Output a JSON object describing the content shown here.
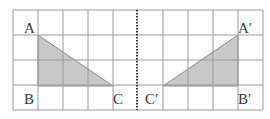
{
  "diagram": {
    "grid": {
      "left": 13,
      "top": 10,
      "cell": 25,
      "cols": 10,
      "rows": 4,
      "line_color": "#9a9a9a"
    },
    "mirror_line": {
      "x": 137,
      "style": "dotted",
      "color": "#333333"
    },
    "shape_fill": "#c8c8c8",
    "shape_stroke": "#8a8a8a",
    "triangles": [
      {
        "name": "ABC",
        "points": [
          [
            38,
            35
          ],
          [
            38,
            86
          ],
          [
            113,
            86
          ]
        ],
        "labels": [
          {
            "text": "A",
            "x": 24,
            "y": 33
          },
          {
            "text": "B",
            "x": 24,
            "y": 104
          },
          {
            "text": "C",
            "x": 113,
            "y": 104
          }
        ]
      },
      {
        "name": "A′B′C′",
        "points": [
          [
            238,
            35
          ],
          [
            238,
            86
          ],
          [
            163,
            86
          ]
        ],
        "labels": [
          {
            "text": "A′",
            "x": 238,
            "y": 33
          },
          {
            "text": "B′",
            "x": 238,
            "y": 104
          },
          {
            "text": "C′",
            "x": 145,
            "y": 104
          }
        ]
      }
    ]
  }
}
